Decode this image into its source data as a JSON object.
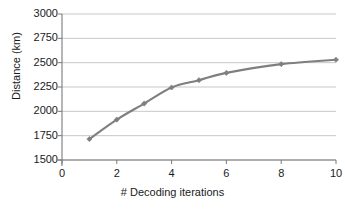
{
  "chart_data": {
    "type": "line",
    "title": "",
    "xlabel": "# Decoding iterations",
    "ylabel": "Distance (km)",
    "xlim": [
      0,
      10
    ],
    "ylim": [
      1500,
      3000
    ],
    "xticks": [
      0,
      2,
      4,
      6,
      8,
      10
    ],
    "xtick_labels": [
      "0",
      "2",
      "4",
      "6",
      "8",
      "10"
    ],
    "yticks": [
      1500,
      1750,
      2000,
      2250,
      2500,
      2750,
      3000
    ],
    "ytick_labels": [
      "1500",
      "1750",
      "2000",
      "2250",
      "2500",
      "2750",
      "3000"
    ],
    "grid": "horizontal",
    "legend": "none",
    "series": [
      {
        "name": "Distance",
        "color": "#7f7f7f",
        "marker": "diamond",
        "x": [
          1,
          2,
          3,
          4,
          5,
          6,
          8,
          10
        ],
        "values": [
          1715,
          1915,
          2080,
          2245,
          2320,
          2395,
          2485,
          2530
        ]
      }
    ]
  },
  "axes": {
    "y_title": "Distance (km)",
    "x_title": "# Decoding iterations"
  },
  "colors": {
    "series_line": "#7f7f7f",
    "gridline": "#b9b9b9",
    "axis": "#7a7a7a",
    "text": "#1a1a1a",
    "background": "#ffffff"
  }
}
